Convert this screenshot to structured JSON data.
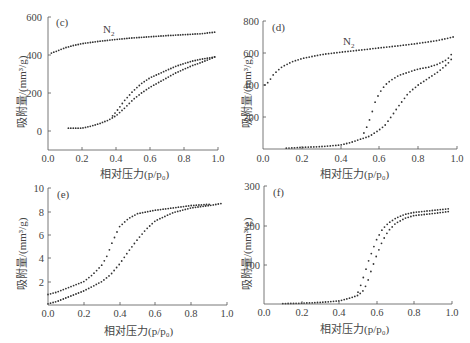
{
  "chart_data": [
    {
      "panel": "(c)",
      "type": "scatter",
      "annotation": "N2",
      "xlabel": "相对压力(p/p0)",
      "ylabel": "吸附量/(mm³/g)",
      "xlim": [
        0.0,
        1.0
      ],
      "ylim": [
        -100,
        600
      ],
      "xticks": [
        "0.0",
        "0.2",
        "0.4",
        "0.6",
        "0.8",
        "1.0"
      ],
      "yticks": [
        "0",
        "200",
        "400",
        "600"
      ],
      "series": [
        {
          "name": "N2 upper (adsorption/desorption)",
          "x": [
            0.02,
            0.05,
            0.1,
            0.15,
            0.2,
            0.3,
            0.4,
            0.5,
            0.6,
            0.7,
            0.8,
            0.9,
            0.98
          ],
          "y": [
            410,
            420,
            438,
            450,
            460,
            472,
            482,
            490,
            496,
            502,
            507,
            512,
            520
          ]
        },
        {
          "name": "Adsorption branch",
          "x": [
            0.12,
            0.15,
            0.2,
            0.25,
            0.3,
            0.35,
            0.4,
            0.45,
            0.5,
            0.55,
            0.6,
            0.65,
            0.7,
            0.75,
            0.8,
            0.85,
            0.9,
            0.95,
            0.98
          ],
          "y": [
            15,
            15,
            15,
            25,
            38,
            55,
            80,
            120,
            165,
            200,
            230,
            255,
            280,
            305,
            325,
            345,
            360,
            378,
            390
          ]
        },
        {
          "name": "Desorption branch",
          "x": [
            0.38,
            0.4,
            0.45,
            0.5,
            0.55,
            0.6,
            0.65,
            0.7,
            0.75,
            0.8,
            0.85,
            0.9,
            0.95,
            0.98
          ],
          "y": [
            80,
            100,
            160,
            210,
            250,
            280,
            300,
            320,
            340,
            355,
            368,
            378,
            385,
            390
          ]
        }
      ]
    },
    {
      "panel": "(d)",
      "type": "scatter",
      "annotation": "N2",
      "xlabel": "相对压力(p/p0)",
      "ylabel": "吸附量/(mm³/g)",
      "xlim": [
        0.0,
        1.0
      ],
      "ylim": [
        0,
        800
      ],
      "xticks": [
        "0.0",
        "0.2",
        "0.4",
        "0.6",
        "0.8",
        "1.0"
      ],
      "yticks": [
        "200",
        "400",
        "600",
        "800"
      ],
      "series": [
        {
          "name": "N2 upper",
          "x": [
            0.01,
            0.03,
            0.05,
            0.08,
            0.1,
            0.15,
            0.2,
            0.3,
            0.4,
            0.5,
            0.6,
            0.7,
            0.8,
            0.9,
            0.98
          ],
          "y": [
            400,
            420,
            460,
            495,
            515,
            545,
            565,
            590,
            605,
            618,
            632,
            645,
            660,
            678,
            700
          ]
        },
        {
          "name": "Adsorption branch",
          "x": [
            0.12,
            0.2,
            0.3,
            0.4,
            0.45,
            0.5,
            0.55,
            0.6,
            0.63,
            0.66,
            0.7,
            0.75,
            0.8,
            0.85,
            0.9,
            0.95,
            0.97
          ],
          "y": [
            5,
            10,
            15,
            25,
            40,
            60,
            80,
            120,
            150,
            200,
            270,
            350,
            400,
            440,
            480,
            530,
            560
          ]
        },
        {
          "name": "Desorption branch",
          "x": [
            0.52,
            0.54,
            0.56,
            0.58,
            0.6,
            0.63,
            0.66,
            0.7,
            0.75,
            0.8,
            0.85,
            0.9,
            0.95,
            0.97
          ],
          "y": [
            100,
            150,
            220,
            300,
            350,
            400,
            430,
            460,
            480,
            500,
            510,
            530,
            560,
            590
          ]
        }
      ]
    },
    {
      "panel": "(e)",
      "type": "scatter",
      "annotation": "",
      "xlabel": "相对压力(p/p0)",
      "ylabel": "吸附量/(mm³/g)",
      "xlim": [
        0.0,
        1.0
      ],
      "ylim": [
        0,
        10
      ],
      "xticks": [
        "0.0",
        "0.2",
        "0.4",
        "0.6",
        "0.8",
        "1.0"
      ],
      "yticks": [
        "2",
        "4",
        "6",
        "8",
        "10"
      ],
      "series": [
        {
          "name": "Adsorption branch",
          "x": [
            0.0,
            0.05,
            0.1,
            0.2,
            0.3,
            0.35,
            0.4,
            0.45,
            0.5,
            0.55,
            0.6,
            0.7,
            0.8,
            0.9,
            0.98
          ],
          "y": [
            0.1,
            0.3,
            0.6,
            1.2,
            2.0,
            2.6,
            3.5,
            4.6,
            5.6,
            6.5,
            7.2,
            7.9,
            8.3,
            8.5,
            8.7
          ]
        },
        {
          "name": "Desorption branch",
          "x": [
            0.0,
            0.05,
            0.1,
            0.2,
            0.25,
            0.3,
            0.33,
            0.36,
            0.4,
            0.45,
            0.5,
            0.6,
            0.7,
            0.8,
            0.9
          ],
          "y": [
            0.9,
            1.1,
            1.4,
            2.0,
            2.6,
            3.4,
            4.2,
            5.4,
            6.7,
            7.4,
            7.8,
            8.1,
            8.3,
            8.5,
            8.6
          ]
        }
      ]
    },
    {
      "panel": "(f)",
      "type": "scatter",
      "annotation": "",
      "xlabel": "相对压力(p/p0)",
      "ylabel": "吸附量/(mm³/g)",
      "xlim": [
        0.0,
        1.0
      ],
      "ylim": [
        0,
        300
      ],
      "xticks": [
        "0.0",
        "0.2",
        "0.4",
        "0.6",
        "0.8",
        "1.0"
      ],
      "yticks": [
        "100",
        "200",
        "300"
      ],
      "series": [
        {
          "name": "Adsorption branch",
          "x": [
            0.1,
            0.2,
            0.3,
            0.4,
            0.45,
            0.5,
            0.53,
            0.55,
            0.57,
            0.6,
            0.63,
            0.66,
            0.7,
            0.75,
            0.8,
            0.9,
            0.98
          ],
          "y": [
            1,
            2,
            4,
            8,
            14,
            22,
            35,
            55,
            85,
            125,
            160,
            185,
            205,
            218,
            225,
            230,
            235
          ]
        },
        {
          "name": "Desorption branch",
          "x": [
            0.5,
            0.52,
            0.54,
            0.56,
            0.58,
            0.6,
            0.63,
            0.66,
            0.7,
            0.75,
            0.8,
            0.9,
            0.98
          ],
          "y": [
            30,
            55,
            85,
            115,
            140,
            165,
            190,
            205,
            218,
            228,
            233,
            238,
            242
          ]
        }
      ]
    }
  ],
  "panels": {
    "c": {
      "label": "(c)",
      "annotation_main": "N",
      "annotation_sub": "2",
      "yticks": [
        "600",
        "400",
        "200",
        "0"
      ],
      "xticks": [
        "0.0",
        "0.2",
        "0.4",
        "0.6",
        "0.8",
        "1.0"
      ],
      "ylabel": "吸附量/(mm³/g)",
      "xlabel": "相对压力(p/p₀)"
    },
    "d": {
      "label": "(d)",
      "annotation_main": "N",
      "annotation_sub": "2",
      "yticks": [
        "800",
        "600",
        "400",
        "200"
      ],
      "xticks": [
        "0.0",
        "0.2",
        "0.4",
        "0.6",
        "0.8",
        "1.0"
      ],
      "ylabel": "吸附量/(mm³/g)",
      "xlabel": "相对压力(p/p₀)"
    },
    "e": {
      "label": "(e)",
      "yticks": [
        "10",
        "8",
        "6",
        "4",
        "2"
      ],
      "xticks": [
        "0.0",
        "0.2",
        "0.4",
        "0.6",
        "0.8",
        "1.0"
      ],
      "ylabel": "吸附量/(mm³/g)",
      "xlabel": "相对压力(p/p₀)"
    },
    "f": {
      "label": "(f)",
      "yticks": [
        "300",
        "200",
        "100"
      ],
      "xticks": [
        "0.0",
        "0.2",
        "0.4",
        "0.6",
        "0.8",
        "1.0"
      ],
      "ylabel": "吸附量/(mm³/g)",
      "xlabel": "相对压力(p/p₀)"
    }
  }
}
